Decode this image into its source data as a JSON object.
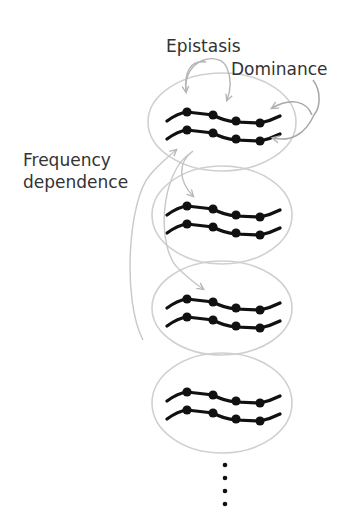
{
  "labels": {
    "epistasis": "Epistasis",
    "dominance": "Dominance",
    "frequency_line1": "Frequency",
    "frequency_line2": "dependence"
  },
  "colors": {
    "background": "#ffffff",
    "text": "#333333",
    "ellipse_stroke": "#d0d0d0",
    "arrow_stroke": "#b5b5b5",
    "chromosome": "#111111"
  },
  "individuals": [
    {
      "id": 1,
      "cy": 122
    },
    {
      "id": 2,
      "cy": 213
    },
    {
      "id": 3,
      "cy": 306
    },
    {
      "id": 4,
      "cy": 399
    }
  ],
  "continuation_dots": 4
}
